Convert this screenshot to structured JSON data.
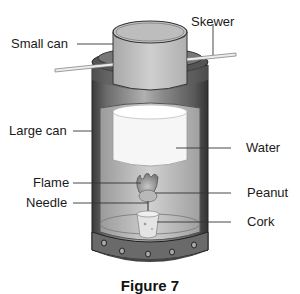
{
  "diagram": {
    "caption": "Figure 7",
    "labels": {
      "small_can": "Small can",
      "skewer": "Skewer",
      "large_can": "Large can",
      "water": "Water",
      "flame": "Flame",
      "peanut": "Peanut",
      "needle": "Needle",
      "cork": "Cork"
    },
    "colors": {
      "can_dark": "#4a4a4a",
      "can_mid": "#8a8a8a",
      "can_light": "#c8c8c8",
      "interior": "#b8b8b8",
      "water": "#f4f4f4",
      "small_can": "#c0c0c0",
      "skewer": "#e8e8e8",
      "leader_line": "#333333"
    }
  }
}
